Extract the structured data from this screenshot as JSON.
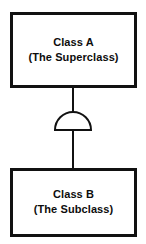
{
  "diagram": {
    "type": "uml-class-inheritance",
    "background_color": "#ffffff",
    "line_color": "#111111",
    "text_color": "#0d0d0d",
    "superclass": {
      "name": "Class A",
      "note": "(The Superclass)"
    },
    "subclass": {
      "name": "Class B",
      "note": "(The Subclass)"
    },
    "connector": {
      "symbol_name": "generalization-semicircle",
      "from": "Class B",
      "to": "Class A"
    }
  }
}
